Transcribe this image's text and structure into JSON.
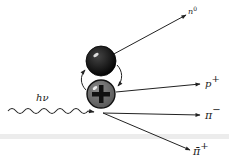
{
  "diagram": {
    "type": "particle-interaction",
    "incoming": {
      "label": "hν",
      "kind": "photon"
    },
    "nucleus": [
      {
        "name": "neutron",
        "symbol": "",
        "color": "#111111"
      },
      {
        "name": "proton",
        "symbol": "+",
        "color": "#6e6e6e"
      }
    ],
    "outgoing": [
      {
        "label": "n",
        "superscript": "0"
      },
      {
        "label": "p",
        "superscript": "+"
      },
      {
        "label": "π",
        "superscript": "−"
      },
      {
        "label": "π̄",
        "superscript": "+"
      }
    ],
    "colors": {
      "line": "#222222",
      "neutron": "#111111",
      "proton": "#6e6e6e",
      "band": "#e6e6e6"
    }
  }
}
